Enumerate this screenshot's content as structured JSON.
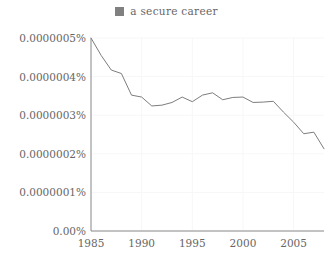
{
  "legend": {
    "swatch_color": "#808080",
    "label": "a secure career"
  },
  "axis": {
    "y_labels": [
      "0.0000005%",
      "0.0000004%",
      "0.0000003%",
      "0.0000002%",
      "0.0000001%",
      "0.00%"
    ],
    "x_labels": [
      "1985",
      "1990",
      "1995",
      "2000",
      "2005"
    ]
  },
  "style": {
    "line_color": "#7d7d7d",
    "grid_color": "#f7f7f7",
    "axis_color": "#8a8a8a",
    "background": "#ffffff"
  },
  "chart_data": {
    "type": "line",
    "title": "",
    "subtitle": "",
    "xlabel": "",
    "ylabel": "",
    "grid": true,
    "legend_position": "top-center",
    "xlim": [
      1985,
      2008
    ],
    "ylim": [
      0,
      5e-07
    ],
    "xticks": [
      1985,
      1990,
      1995,
      2000,
      2005
    ],
    "yticks": [
      0,
      1e-07,
      2e-07,
      3e-07,
      4e-07,
      5e-07
    ],
    "ytick_labels": [
      "0.00%",
      "0.0000001%",
      "0.0000002%",
      "0.0000003%",
      "0.0000004%",
      "0.0000005%"
    ],
    "x": [
      1985,
      1986,
      1987,
      1988,
      1989,
      1990,
      1991,
      1992,
      1993,
      1994,
      1995,
      1996,
      1997,
      1998,
      1999,
      2000,
      2001,
      2002,
      2003,
      2004,
      2005,
      2006,
      2007,
      2008
    ],
    "series": [
      {
        "name": "a secure career",
        "color": "#7d7d7d",
        "values": [
          5e-07,
          4.55e-07,
          4.17e-07,
          4.08e-07,
          3.52e-07,
          3.47e-07,
          3.24e-07,
          3.26e-07,
          3.33e-07,
          3.47e-07,
          3.35e-07,
          3.52e-07,
          3.58e-07,
          3.4e-07,
          3.46e-07,
          3.47e-07,
          3.33e-07,
          3.34e-07,
          3.36e-07,
          3.08e-07,
          2.82e-07,
          2.52e-07,
          2.56e-07,
          2.13e-07
        ]
      }
    ]
  }
}
